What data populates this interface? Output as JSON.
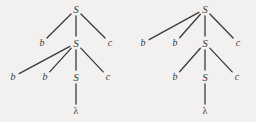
{
  "figure": {
    "kind": "parse-tree-pair",
    "background_color": "#f2f1ef",
    "ink_color": "#3a3a3a",
    "width": 256,
    "height": 122,
    "grammar_rule": "S -> bSc | lambda"
  },
  "trees": [
    {
      "id": "left-tree",
      "name": "leftmost-derivation-tree",
      "nodes": [
        {
          "id": "L-S0",
          "label": "S",
          "kind": "nonterminal",
          "x": 76,
          "y": 9
        },
        {
          "id": "L-b1",
          "label": "b",
          "kind": "terminal",
          "x": 42,
          "y": 43
        },
        {
          "id": "L-S1",
          "label": "S",
          "kind": "nonterminal",
          "x": 76,
          "y": 43
        },
        {
          "id": "L-c1",
          "label": "c",
          "kind": "terminal",
          "x": 110,
          "y": 43
        },
        {
          "id": "L-b2",
          "label": "b",
          "kind": "terminal",
          "x": 13,
          "y": 77
        },
        {
          "id": "L-b3",
          "label": "b",
          "kind": "terminal",
          "x": 45,
          "y": 77
        },
        {
          "id": "L-S2",
          "label": "S",
          "kind": "nonterminal",
          "x": 76,
          "y": 77
        },
        {
          "id": "L-c2",
          "label": "c",
          "kind": "terminal",
          "x": 108,
          "y": 77
        },
        {
          "id": "L-lam",
          "label": "λ",
          "kind": "lambda",
          "x": 76,
          "y": 111
        }
      ],
      "edges": [
        {
          "from": "L-S0",
          "to": "L-b1"
        },
        {
          "from": "L-S0",
          "to": "L-S1"
        },
        {
          "from": "L-S0",
          "to": "L-c1"
        },
        {
          "from": "L-S1",
          "to": "L-b2"
        },
        {
          "from": "L-S1",
          "to": "L-b3"
        },
        {
          "from": "L-S1",
          "to": "L-S2"
        },
        {
          "from": "L-S1",
          "to": "L-c2"
        },
        {
          "from": "L-S2",
          "to": "L-lam"
        }
      ]
    },
    {
      "id": "right-tree",
      "name": "rightmost-derivation-tree",
      "nodes": [
        {
          "id": "R-S0",
          "label": "S",
          "kind": "nonterminal",
          "x": 205,
          "y": 9
        },
        {
          "id": "R-b1",
          "label": "b",
          "kind": "terminal",
          "x": 143,
          "y": 43
        },
        {
          "id": "R-b2",
          "label": "b",
          "kind": "terminal",
          "x": 175,
          "y": 43
        },
        {
          "id": "R-S1",
          "label": "S",
          "kind": "nonterminal",
          "x": 205,
          "y": 43
        },
        {
          "id": "R-c1",
          "label": "c",
          "kind": "terminal",
          "x": 238,
          "y": 43
        },
        {
          "id": "R-b3",
          "label": "b",
          "kind": "terminal",
          "x": 175,
          "y": 77
        },
        {
          "id": "R-S2",
          "label": "S",
          "kind": "nonterminal",
          "x": 205,
          "y": 77
        },
        {
          "id": "R-c2",
          "label": "c",
          "kind": "terminal",
          "x": 237,
          "y": 77
        },
        {
          "id": "R-lam",
          "label": "λ",
          "kind": "lambda",
          "x": 205,
          "y": 111
        }
      ],
      "edges": [
        {
          "from": "R-S0",
          "to": "R-b1"
        },
        {
          "from": "R-S0",
          "to": "R-b2"
        },
        {
          "from": "R-S0",
          "to": "R-S1"
        },
        {
          "from": "R-S0",
          "to": "R-c1"
        },
        {
          "from": "R-S1",
          "to": "R-b3"
        },
        {
          "from": "R-S1",
          "to": "R-S2"
        },
        {
          "from": "R-S1",
          "to": "R-c2"
        },
        {
          "from": "R-S2",
          "to": "R-lam"
        }
      ]
    }
  ]
}
